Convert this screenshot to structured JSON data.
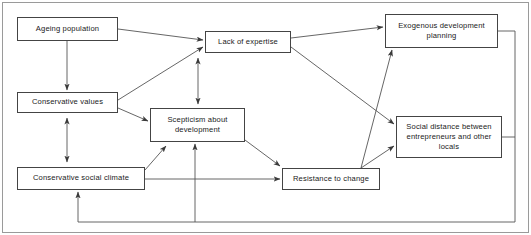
{
  "diagram": {
    "type": "causal-loop-flowchart",
    "frame": {
      "border_color": "#8a8a8a",
      "background": "#ffffff"
    },
    "line_color": "#555555",
    "nodes": [
      {
        "id": "ageing-population",
        "label": "Ageing population",
        "x": 17,
        "y": 17,
        "w": 101,
        "h": 24
      },
      {
        "id": "conservative-values",
        "label": "Conservative values",
        "x": 17,
        "y": 92,
        "w": 101,
        "h": 21
      },
      {
        "id": "conservative-social-climate",
        "label": "Conservative social climate",
        "x": 17,
        "y": 167,
        "w": 128,
        "h": 23
      },
      {
        "id": "lack-of-expertise",
        "label": "Lack of expertise",
        "x": 205,
        "y": 31,
        "w": 86,
        "h": 22
      },
      {
        "id": "scepticism-about-development",
        "label": "Scepticism about\ndevelopment",
        "x": 150,
        "y": 108,
        "w": 95,
        "h": 34
      },
      {
        "id": "resistance-to-change",
        "label": "Resistance to change",
        "x": 282,
        "y": 168,
        "w": 98,
        "h": 22
      },
      {
        "id": "exogenous-development-planning",
        "label": "Exogenous development\nplanning",
        "x": 385,
        "y": 14,
        "w": 113,
        "h": 34
      },
      {
        "id": "social-distance",
        "label": "Social distance between\nentrepreneurs and other\nlocals",
        "x": 396,
        "y": 116,
        "w": 106,
        "h": 42
      }
    ],
    "edges": [
      {
        "id": "ageing-to-lack",
        "from": "ageing-population",
        "to": "lack-of-expertise",
        "arrow": "single"
      },
      {
        "id": "ageing-to-conservative-values",
        "from": "ageing-population",
        "to": "conservative-values",
        "arrow": "single"
      },
      {
        "id": "values-to-lack",
        "from": "conservative-values",
        "to": "lack-of-expertise",
        "arrow": "single"
      },
      {
        "id": "values-to-scepticism",
        "from": "conservative-values",
        "to": "scepticism-about-development",
        "arrow": "single"
      },
      {
        "id": "values-climate",
        "from": "conservative-values",
        "to": "conservative-social-climate",
        "arrow": "double"
      },
      {
        "id": "climate-to-scepticism",
        "from": "conservative-social-climate",
        "to": "scepticism-about-development",
        "arrow": "single"
      },
      {
        "id": "climate-to-resistance",
        "from": "conservative-social-climate",
        "to": "resistance-to-change",
        "arrow": "single"
      },
      {
        "id": "lack-scepticism",
        "from": "lack-of-expertise",
        "to": "scepticism-about-development",
        "arrow": "double"
      },
      {
        "id": "lack-to-exogenous",
        "from": "lack-of-expertise",
        "to": "exogenous-development-planning",
        "arrow": "single"
      },
      {
        "id": "lack-to-social-distance",
        "from": "lack-of-expertise",
        "to": "social-distance",
        "arrow": "single"
      },
      {
        "id": "scepticism-to-resistance",
        "from": "scepticism-about-development",
        "to": "resistance-to-change",
        "arrow": "single"
      },
      {
        "id": "resistance-to-social-distance",
        "from": "resistance-to-change",
        "to": "social-distance",
        "arrow": "single"
      },
      {
        "id": "resistance-to-exogenous",
        "from": "resistance-to-change",
        "to": "exogenous-development-planning",
        "arrow": "single"
      },
      {
        "id": "exogenous-feedback-to-climate",
        "from": "exogenous-development-planning",
        "to": "conservative-social-climate",
        "arrow": "single"
      },
      {
        "id": "social-distance-feedback-to-scepticism",
        "from": "social-distance",
        "to": "scepticism-about-development",
        "arrow": "single"
      }
    ]
  }
}
